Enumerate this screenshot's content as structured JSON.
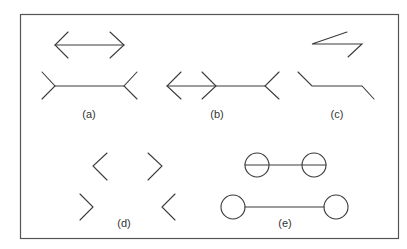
{
  "figure": {
    "stroke_color": "#3a3a3a",
    "frame_color": "#555555",
    "labels": {
      "a": "(a)",
      "b": "(b)",
      "c": "(c)",
      "d": "(d)",
      "e": "(e)"
    },
    "panels": [
      {
        "id": "a",
        "description": "Muller-Lyer illusion: arrowheads vs. fins"
      },
      {
        "id": "b",
        "description": "Muller-Lyer combined line with inward and outward heads"
      },
      {
        "id": "c",
        "description": "Zigzag variant with angled ends"
      },
      {
        "id": "d",
        "description": "Angle pairs without connecting shafts"
      },
      {
        "id": "e",
        "description": "Circle-ended lines (Delboeuf-type variant)"
      }
    ]
  }
}
